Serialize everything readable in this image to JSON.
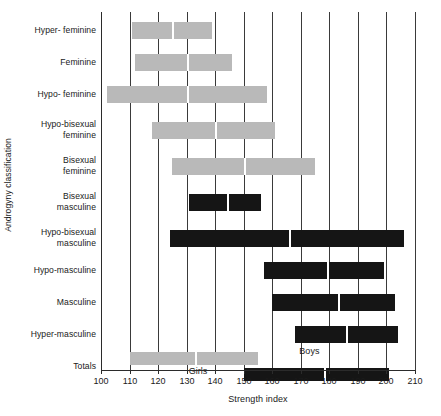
{
  "chart_data": {
    "type": "bar",
    "orientation": "horizontal",
    "title": "",
    "xlabel": "Strength index",
    "ylabel": "Androgyny classification",
    "xlim": [
      100,
      210
    ],
    "xticks": [
      100,
      110,
      120,
      130,
      140,
      150,
      160,
      170,
      180,
      190,
      200,
      210
    ],
    "grid": "vertical",
    "legend": "inline",
    "categories": [
      "Hyper- feminine",
      "Feminine",
      "Hypo- feminine",
      "Hypo-bisexual feminine",
      "Bisexual feminine",
      "Bisexual masculine",
      "Hypo-bisexual masculine",
      "Hypo-masculine",
      "Masculine",
      "Hyper-masculine",
      "Totals"
    ],
    "series": [
      {
        "name": "Girls",
        "color": "#b9b9b9",
        "ranges": [
          {
            "category": "Hyper- feminine",
            "start": 111,
            "median": 125,
            "end": 139
          },
          {
            "category": "Feminine",
            "start": 112,
            "median": 130,
            "end": 146
          },
          {
            "category": "Hypo- feminine",
            "start": 102,
            "median": 130,
            "end": 158
          },
          {
            "category": "Hypo-bisexual feminine",
            "start": 118,
            "median": 140,
            "end": 161
          },
          {
            "category": "Bisexual feminine",
            "start": 125,
            "median": 150,
            "end": 175
          },
          {
            "category": "Totals",
            "start": 110,
            "median": 133,
            "end": 155
          }
        ]
      },
      {
        "name": "Boys",
        "color": "#151515",
        "ranges": [
          {
            "category": "Bisexual masculine",
            "start": 131,
            "median": 144,
            "end": 156
          },
          {
            "category": "Hypo-bisexual masculine",
            "start": 124,
            "median": 166,
            "end": 206
          },
          {
            "category": "Hypo-masculine",
            "start": 157,
            "median": 179,
            "end": 199
          },
          {
            "category": "Masculine",
            "start": 160,
            "median": 183,
            "end": 203
          },
          {
            "category": "Hyper-masculine",
            "start": 168,
            "median": 186,
            "end": 204
          },
          {
            "category": "Totals",
            "start": 150,
            "median": 178,
            "end": 201
          }
        ]
      }
    ],
    "inline_labels": [
      {
        "text": "Girls",
        "value": 134
      },
      {
        "text": "Boys",
        "value": 173
      }
    ]
  }
}
